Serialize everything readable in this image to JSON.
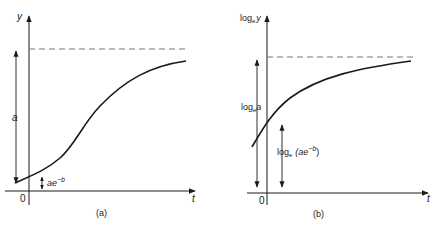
{
  "figure": {
    "panels": [
      {
        "id": "a",
        "caption": "(a)",
        "y_axis_label": "y",
        "x_axis_label": "t",
        "origin_label": "0",
        "height_label": "a",
        "intercept_label_base": "ae",
        "intercept_label_exp": "−b",
        "curve_type": "sigmoid (Gompertz) rising to asymptote a",
        "asymptote": "dashed"
      },
      {
        "id": "b",
        "caption": "(b)",
        "y_axis_label_prefix": "log",
        "y_axis_label_sub": "e",
        "y_axis_label_var": "y",
        "x_axis_label": "t",
        "origin_label": "0",
        "height_label_prefix": "log",
        "height_label_sub": "e",
        "height_label_var": "a",
        "intercept_label_prefix": "log",
        "intercept_label_sub": "e",
        "intercept_label_base": "(ae",
        "intercept_label_exp": "−b",
        "intercept_label_close": ")",
        "curve_type": "concave rising to asymptote log_e a",
        "asymptote": "dashed"
      }
    ],
    "colors": {
      "line": "#1a1a1a",
      "dashed": "#777777",
      "background": "#ffffff"
    }
  }
}
